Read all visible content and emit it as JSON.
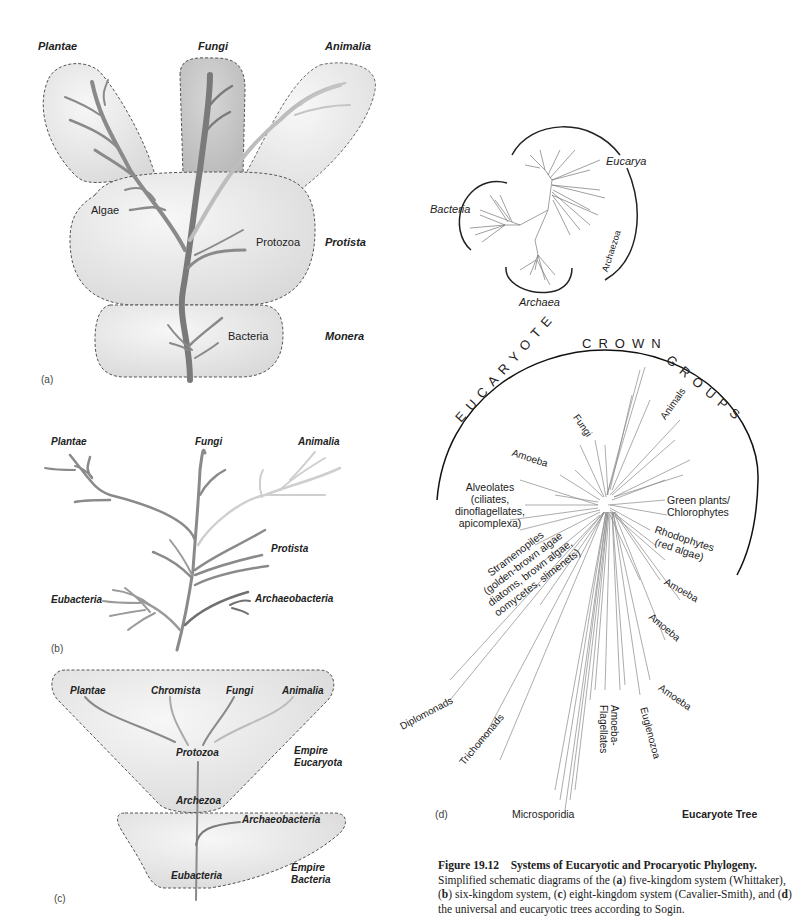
{
  "panel_a": {
    "tag": "(a)",
    "kingdoms": {
      "plantae": "Plantae",
      "fungi": "Fungi",
      "animalia": "Animalia",
      "protista": "Protista",
      "monera": "Monera"
    },
    "inner": {
      "algae": "Algae",
      "protozoa": "Protozoa",
      "bacteria": "Bacteria"
    }
  },
  "panel_b": {
    "tag": "(b)",
    "labels": {
      "plantae": "Plantae",
      "fungi": "Fungi",
      "animalia": "Animalia",
      "protista": "Protista",
      "eubacteria": "Eubacteria",
      "archaeobacteria": "Archaeobacteria"
    }
  },
  "panel_c": {
    "tag": "(c)",
    "labels": {
      "plantae": "Plantae",
      "chromista": "Chromista",
      "fungi": "Fungi",
      "animalia": "Animalia",
      "protozoa": "Protozoa",
      "archezoa": "Archezoa",
      "archaeobacteria": "Archaeobacteria",
      "eubacteria": "Eubacteria",
      "empire_eucaryota_1": "Empire",
      "empire_eucaryota_2": "Eucaryota",
      "empire_bacteria_1": "Empire",
      "empire_bacteria_2": "Bacteria"
    }
  },
  "panel_d_universal": {
    "labels": {
      "eucarya": "Eucarya",
      "bacteria": "Bacteria",
      "archaea": "Archaea",
      "archaezoa": "Archaezoa"
    }
  },
  "panel_d": {
    "tag": "(d)",
    "arc_title": "EUCARYOTE CROWN GROUPS",
    "title": "Eucaryote Tree",
    "labels": {
      "fungi": "Fungi",
      "animals": "Animals",
      "amoeba_1": "Amoeba",
      "alveolates": [
        "Alveolates",
        "(ciliates,",
        "dinoflagellates,",
        "apicomplexa)"
      ],
      "green_plants": [
        "Green plants/",
        "Chlorophytes"
      ],
      "rhodophytes": [
        "Rhodophytes",
        "(red algae)"
      ],
      "stramenopiles": [
        "Stramenopiles",
        "(golden-brown algae",
        "diatoms, brown algae,",
        "oomycetes, slimenets)"
      ],
      "amoeba_2": "Amoeba",
      "amoeba_3": "Amoeba",
      "amoeba_4": "Amoeba",
      "diplomonads": "Diplomonads",
      "trichomonads": "Trichomonads",
      "amoeba_flagellates": [
        "Amoeba-",
        "Flagellates"
      ],
      "euglenozoa": "Euglenozoa",
      "microsporidia": "Microsporidia"
    }
  },
  "caption": {
    "figure_no": "Figure 19.12",
    "title": "Systems of Eucaryotic and Procaryotic Phylogeny.",
    "body_1": "Simplified schematic diagrams of the (",
    "a": "a",
    "body_2": ") five-kingdom system (Whittaker), (",
    "b": "b",
    "body_3": ") six-kingdom system, (",
    "c": "c",
    "body_4": ") eight-kingdom system (Cavalier-Smith), and (",
    "d": "d",
    "body_5": ") the universal and eucaryotic trees according to Sogin."
  },
  "colors": {
    "bubble_fill": "#e6e6e6",
    "fungi_fill": "#c8c8c8",
    "trunk": "#7a7a7a",
    "light_branch": "#c4c4c4",
    "dash": "#555555"
  }
}
